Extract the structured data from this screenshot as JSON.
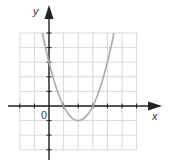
{
  "chart_data": {
    "type": "line",
    "title": "",
    "function": "y = x^2 - 4x + 3",
    "xlabel": "x",
    "ylabel": "y",
    "origin_label": "0",
    "xlim": [
      -2,
      6
    ],
    "ylim": [
      -3,
      5
    ],
    "grid": true,
    "grid_step": 1,
    "series": [
      {
        "name": "parabola",
        "color": "#aaaaaa",
        "x": [
          -0.45,
          0,
          0.5,
          1,
          1.5,
          2,
          2.5,
          3,
          3.5,
          4,
          4.45
        ],
        "y": [
          5,
          3,
          1.25,
          0,
          -0.75,
          -1,
          -0.75,
          0,
          1.25,
          3,
          5
        ]
      }
    ],
    "key_points": {
      "x_intercepts": [
        1,
        3
      ],
      "y_intercept": 3,
      "vertex": [
        2,
        -1
      ]
    },
    "colors": {
      "axis": "#222222",
      "grid": "#d8d8d8",
      "curve": "#aaaaaa"
    }
  }
}
